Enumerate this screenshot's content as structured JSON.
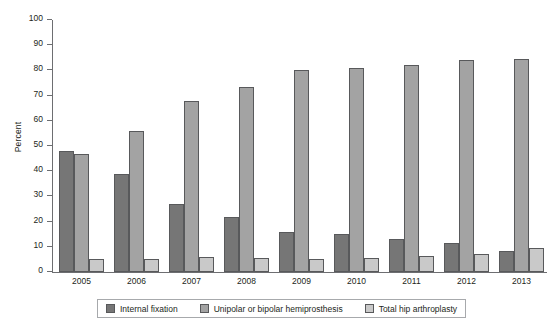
{
  "chart_data": {
    "type": "bar",
    "title": "",
    "xlabel": "",
    "ylabel": "Percent",
    "ylim": [
      0,
      100
    ],
    "ytick_step": 10,
    "yticks": [
      0,
      10,
      20,
      30,
      40,
      50,
      60,
      70,
      80,
      90,
      100
    ],
    "grid": false,
    "legend_position": "bottom",
    "categories": [
      "2005",
      "2006",
      "2007",
      "2008",
      "2009",
      "2010",
      "2011",
      "2012",
      "2013"
    ],
    "series": [
      {
        "name": "Internal fixation",
        "color": "#767676",
        "values": [
          48,
          39,
          27,
          22,
          16,
          15,
          13,
          11.5,
          8.5
        ]
      },
      {
        "name": "Unipolar or bipolar hemiprosthesis",
        "color": "#a3a3a3",
        "values": [
          47,
          56,
          68,
          73.5,
          80,
          81,
          82,
          84,
          84.5
        ]
      },
      {
        "name": "Total hip arthroplasty",
        "color": "#c9c9c9",
        "values": [
          5,
          5,
          6,
          5.5,
          5,
          5.5,
          6.5,
          7,
          9.5
        ]
      }
    ]
  }
}
